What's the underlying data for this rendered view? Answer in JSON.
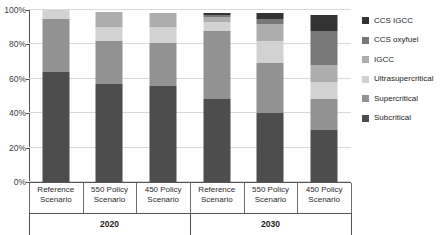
{
  "chart_data": {
    "type": "bar",
    "subtype": "stacked-bar-100-percent",
    "title": "",
    "subtitle": "",
    "xlabel": "",
    "ylabel": "",
    "ylim": [
      0,
      100
    ],
    "ytick_labels": [
      "0%",
      "20%",
      "40%",
      "60%",
      "80%",
      "100%"
    ],
    "ytick_values": [
      0,
      20,
      40,
      60,
      80,
      100
    ],
    "grid": true,
    "legend_position": "right",
    "categories": [
      "Reference Scenario",
      "550 Policy Scenario",
      "450 Policy Scenario",
      "Reference Scenario",
      "550 Policy Scenario",
      "450 Policy Scenario"
    ],
    "category_lines": [
      [
        "Reference",
        "Scenario"
      ],
      [
        "550 Policy",
        "Scenario"
      ],
      [
        "450 Policy",
        "Scenario"
      ],
      [
        "Reference",
        "Scenario"
      ],
      [
        "550 Policy",
        "Scenario"
      ],
      [
        "450 Policy",
        "Scenario"
      ]
    ],
    "groups": [
      {
        "label": "2020",
        "span": 3
      },
      {
        "label": "2030",
        "span": 3
      }
    ],
    "series": [
      {
        "name": "Subcritical",
        "color": "#4d4d4d",
        "values": [
          64,
          57,
          56,
          48,
          40,
          30
        ]
      },
      {
        "name": "Supercritical",
        "color": "#929292",
        "values": [
          31,
          25,
          25,
          40,
          29,
          18
        ]
      },
      {
        "name": "Ultrasupercritical",
        "color": "#d2d2d2",
        "values": [
          5,
          8,
          9,
          5,
          13,
          10
        ]
      },
      {
        "name": "IGCC",
        "color": "#adadad",
        "values": [
          0,
          9,
          8,
          3,
          10,
          10
        ]
      },
      {
        "name": "CCS oxyfuel",
        "color": "#787878",
        "values": [
          0,
          0,
          0,
          1,
          3,
          20
        ]
      },
      {
        "name": "CCS IGCC",
        "color": "#333333",
        "values": [
          0,
          0,
          0,
          1,
          3,
          9
        ]
      }
    ],
    "stack_order_bottom_to_top": [
      "Subcritical",
      "Supercritical",
      "Ultrasupercritical",
      "IGCC",
      "CCS oxyfuel",
      "CCS IGCC"
    ],
    "legend_entries": [
      {
        "label": "CCS IGCC",
        "color": "#333333"
      },
      {
        "label": "CCS oxyfuel",
        "color": "#787878"
      },
      {
        "label": "IGCC",
        "color": "#adadad"
      },
      {
        "label": "Ultrasupercritical",
        "color": "#d2d2d2"
      },
      {
        "label": "Supercritical",
        "color": "#929292"
      },
      {
        "label": "Subcritical",
        "color": "#4d4d4d"
      }
    ]
  }
}
